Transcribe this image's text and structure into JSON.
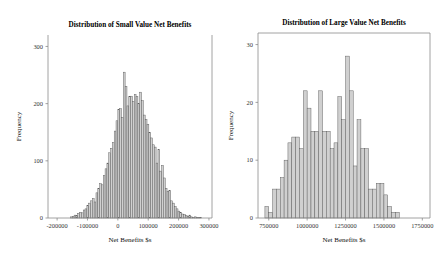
{
  "figure": {
    "width": 444,
    "height": 265,
    "background": "#ffffff",
    "bar_fill": "#d0d0d0",
    "bar_stroke": "#5a5a5a",
    "axis_color": "#8a8a8a"
  },
  "chart_data": [
    {
      "type": "bar",
      "id": "small-value-histogram",
      "title": "Distribution of Small Value Net Benefits",
      "xlabel": "Net Benefits $s",
      "ylabel": "Frequency",
      "grid": false,
      "legend": null,
      "xlim": [
        -230000,
        310000
      ],
      "ylim": [
        0,
        320
      ],
      "xticks": [
        -200000,
        -100000,
        0,
        100000,
        200000,
        300000
      ],
      "xticklabels": [
        "-200000",
        "-100000",
        "0",
        "100000",
        "200000",
        "300000"
      ],
      "yticks": [
        0,
        100,
        200,
        300
      ],
      "yticklabels": [
        "0",
        "100",
        "200",
        "300"
      ],
      "bin_width": 6000,
      "bin_starts": [
        -156000,
        -150000,
        -144000,
        -138000,
        -132000,
        -126000,
        -120000,
        -114000,
        -108000,
        -102000,
        -96000,
        -90000,
        -84000,
        -78000,
        -72000,
        -66000,
        -60000,
        -54000,
        -48000,
        -42000,
        -36000,
        -30000,
        -24000,
        -18000,
        -12000,
        -6000,
        0,
        6000,
        12000,
        18000,
        24000,
        30000,
        36000,
        42000,
        48000,
        54000,
        60000,
        66000,
        72000,
        78000,
        84000,
        90000,
        96000,
        102000,
        108000,
        114000,
        120000,
        126000,
        132000,
        138000,
        144000,
        150000,
        156000,
        162000,
        168000,
        174000,
        180000,
        186000,
        192000,
        198000,
        204000,
        210000,
        216000,
        222000,
        228000,
        234000,
        240000,
        246000,
        252000,
        258000,
        264000,
        270000
      ],
      "values": [
        2,
        3,
        5,
        4,
        8,
        10,
        9,
        14,
        16,
        22,
        26,
        30,
        34,
        28,
        44,
        52,
        60,
        58,
        74,
        86,
        96,
        114,
        122,
        132,
        152,
        170,
        190,
        191,
        176,
        255,
        230,
        196,
        212,
        213,
        204,
        216,
        212,
        200,
        220,
        205,
        180,
        172,
        164,
        150,
        140,
        128,
        124,
        96,
        120,
        82,
        92,
        70,
        52,
        46,
        48,
        30,
        26,
        20,
        16,
        12,
        10,
        7,
        6,
        4,
        3,
        5,
        2,
        1,
        2,
        1,
        1,
        1
      ]
    },
    {
      "type": "bar",
      "id": "large-value-histogram",
      "title": "Distribution of Large Value Net Benefits",
      "xlabel": "Net Benefits $s",
      "ylabel": "Frequency",
      "grid": false,
      "legend": null,
      "xlim": [
        680000,
        1800000
      ],
      "ylim": [
        0,
        32
      ],
      "xticks": [
        750000,
        1000000,
        1250000,
        1500000,
        1750000
      ],
      "xticklabels": [
        "750000",
        "1000000",
        "1250000",
        "1500000",
        "1750000"
      ],
      "yticks": [
        0,
        10,
        20,
        30
      ],
      "yticklabels": [
        "0",
        "10",
        "20",
        "30"
      ],
      "bin_width": 25000,
      "bin_starts": [
        725000,
        750000,
        775000,
        800000,
        825000,
        850000,
        875000,
        900000,
        925000,
        950000,
        975000,
        1000000,
        1025000,
        1050000,
        1075000,
        1100000,
        1125000,
        1150000,
        1175000,
        1200000,
        1225000,
        1250000,
        1275000,
        1300000,
        1325000,
        1350000,
        1375000,
        1400000,
        1425000,
        1450000,
        1475000,
        1500000,
        1525000,
        1550000,
        1575000,
        1600000,
        1625000
      ],
      "values": [
        2,
        1,
        5,
        5,
        7,
        10,
        13,
        14,
        14,
        12,
        22,
        19,
        15,
        15,
        22,
        15,
        15,
        12,
        13,
        21,
        17,
        28,
        22,
        9,
        17,
        12,
        12,
        5,
        5,
        6,
        6,
        4,
        2,
        1,
        1,
        0,
        0
      ]
    }
  ]
}
